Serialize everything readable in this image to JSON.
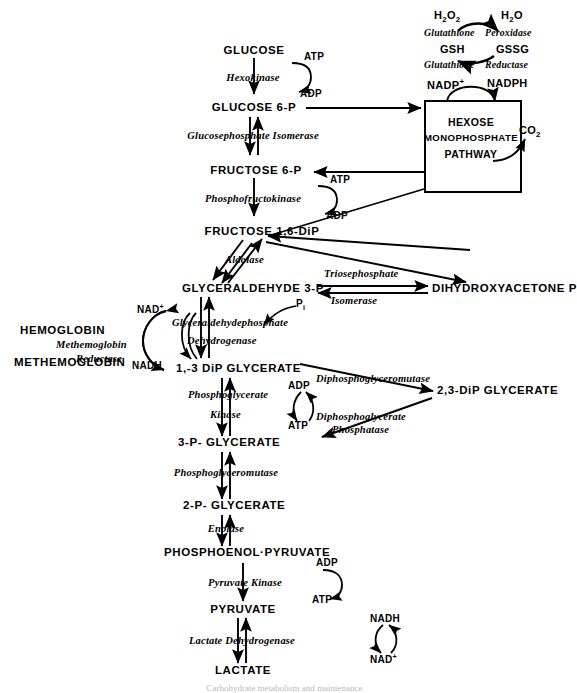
{
  "figure": {
    "caption_partial": "Carbohydrate metabolism and maintenance"
  },
  "hmp_box": {
    "line1": "HEXOSE",
    "line2": "MONOPHOSPHATE",
    "line3": "PATHWAY",
    "output": "CO",
    "output_sub": "2"
  },
  "glutathione_cycle": {
    "h2o2": "H",
    "h2o2_sub1": "2",
    "h2o2_mid": "O",
    "h2o2_sub2": "2",
    "h2o": "H",
    "h2o_sub": "2",
    "h2o_mid": "O",
    "enzyme1_a": "Glutathione",
    "enzyme1_b": "Peroxidase",
    "gsh": "GSH",
    "gssg": "GSSG",
    "enzyme2_a": "Glutathione",
    "enzyme2_b": "Reductase",
    "nadp": "NADP",
    "nadp_sup": "+",
    "nadph": "NADPH"
  },
  "hemoglobin_cycle": {
    "hemoglobin": "HEMOGLOBIN",
    "methemoglobin": "METHEMOGLOBIN",
    "enzyme_a": "Methemoglobin",
    "enzyme_b": "Reductase",
    "nad": "NAD",
    "nad_sup": "+",
    "nadh": "NADH"
  },
  "metabolites": [
    {
      "id": "glucose",
      "label": "GLUCOSE"
    },
    {
      "id": "glucose-6-p",
      "label": "GLUCOSE  6-P"
    },
    {
      "id": "fructose-6-p",
      "label": "FRUCTOSE  6-P"
    },
    {
      "id": "fructose-1-6-dip",
      "label": "FRUCTOSE  1,6-DiP"
    },
    {
      "id": "glyceraldehyde-3-p",
      "label": "GLYCERALDEHYDE  3-P"
    },
    {
      "id": "dihydroxyacetone-p",
      "label": "DIHYDROXYACETONE P"
    },
    {
      "id": "1-3-dip-glycerate",
      "label": "1,-3 DiP GLYCERATE"
    },
    {
      "id": "2-3-dip-glycerate",
      "label": "2,3-DiP  GLYCERATE"
    },
    {
      "id": "3-p-glycerate",
      "label": "3-P- GLYCERATE"
    },
    {
      "id": "2-p-glycerate",
      "label": "2-P- GLYCERATE"
    },
    {
      "id": "phosphoenolpyruvate",
      "label": "PHOSPHOENOL·PYRUVATE"
    },
    {
      "id": "pyruvate",
      "label": "PYRUVATE"
    },
    {
      "id": "lactate",
      "label": "LACTATE"
    }
  ],
  "enzymes": [
    {
      "id": "hexokinase",
      "label": "Hexokinase"
    },
    {
      "id": "glucosephosphate-isomerase",
      "label": "Glucosephosphate  Isomerase"
    },
    {
      "id": "phosphofructokinase",
      "label": "Phosphofructokinase"
    },
    {
      "id": "aldolase",
      "label": "Aldolase"
    },
    {
      "id": "triosephosphate",
      "label": "Triosephosphate"
    },
    {
      "id": "isomerase",
      "label": "Isomerase"
    },
    {
      "id": "glyceraldehydephosphate",
      "label": "Glyceraldehydephosphate"
    },
    {
      "id": "dehydrogenase",
      "label": "Dehydrogenase"
    },
    {
      "id": "phosphoglycerate",
      "label": "Phosphoglycerate"
    },
    {
      "id": "kinase",
      "label": "Kinase"
    },
    {
      "id": "diphosphoglyceromutase",
      "label": "Diphosphoglyceromutase"
    },
    {
      "id": "diphosphoglycerate",
      "label": "Diphosphoglycerate"
    },
    {
      "id": "phosphatase",
      "label": "Phosphatase"
    },
    {
      "id": "phosphoglyceromutase",
      "label": "Phosphoglyceromutase"
    },
    {
      "id": "enolase",
      "label": "Enolase"
    },
    {
      "id": "pyruvate-kinase",
      "label": "Pyruvate  Kinase"
    },
    {
      "id": "lactate-dehydrogenase",
      "label": "Lactate  Dehydrogenase"
    }
  ],
  "cofactors": {
    "atp_1": "ATP",
    "adp_1": "ADP",
    "atp_2": "ATP",
    "adp_2": "ADP",
    "pi": "P",
    "pi_sub": "i",
    "adp_3": "ADP",
    "atp_3": "ATP",
    "adp_4": "ADP",
    "atp_4": "ATP",
    "nadh_ldh": "NADH",
    "nad_ldh": "NAD",
    "nad_ldh_sup": "+"
  },
  "colors": {
    "ink": "#000000",
    "paper": "#ffffff",
    "caption": "#b9b9b9"
  }
}
